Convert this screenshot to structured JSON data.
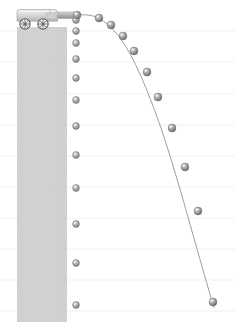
{
  "figure": {
    "domain_type": "diagram",
    "canvas": {
      "width": 235,
      "height": 330,
      "background": "#ffffff"
    },
    "colors": {
      "background": "#ffffff",
      "gridline": "#f0f0f0",
      "column_fill": "#d0d0d0",
      "column_edge": "#c4c4c4",
      "sphere_body": "#9a9a9a",
      "sphere_shadow": "#6d6d6d",
      "sphere_highlight": "#e8e8e8",
      "sphere_outline": "#7c7c7c",
      "trajectory_line": "#9e9e9e",
      "cart_body": "#d9d9d9",
      "cart_edge": "#9d9d9d",
      "cart_dark": "#a8a8a8",
      "wheel_rim": "#6f6f6f",
      "barrel": "#b5b5b5"
    }
  },
  "support_column": {
    "label": "textured gray support column",
    "x": 17,
    "y": 27,
    "width": 50,
    "height": 295,
    "fill": "#d3d3d3"
  },
  "launcher": {
    "label": "spring-loaded launcher cart",
    "body": {
      "x": 16,
      "y": 9,
      "width": 42,
      "height": 13
    },
    "barrel": {
      "x": 55,
      "y": 12,
      "width": 22,
      "height": 7
    },
    "muzzle_x": 76,
    "muzzle_y": 15,
    "wheels": [
      {
        "name": "rear-wheel",
        "cx": 25,
        "cy": 24,
        "r": 5.2
      },
      {
        "name": "front-wheel",
        "cx": 43,
        "cy": 24,
        "r": 5.2
      }
    ]
  },
  "gridlines": {
    "label": "faint horizontal reference lines",
    "x_start": 0,
    "x_end": 235,
    "y_values": [
      31,
      62,
      94,
      125,
      156,
      187,
      218,
      249,
      280,
      311
    ],
    "color": "#f1f1f1",
    "width": 1
  },
  "free_fall_column": {
    "label": "ball released from rest, dropped vertically",
    "x": 76,
    "radius": 3.4,
    "y_values": [
      20,
      31,
      43,
      59,
      78,
      100,
      126,
      155,
      188,
      224,
      263,
      305
    ],
    "count": 12
  },
  "trajectory": {
    "label": "ball launched horizontally, parabolic path",
    "line_color": "#9e9e9e",
    "line_width": 1,
    "radius": 3.9,
    "points": [
      {
        "x": 77,
        "y": 15
      },
      {
        "x": 99,
        "y": 18
      },
      {
        "x": 111,
        "y": 25
      },
      {
        "x": 123,
        "y": 36
      },
      {
        "x": 134,
        "y": 51
      },
      {
        "x": 147,
        "y": 72
      },
      {
        "x": 158,
        "y": 97
      },
      {
        "x": 172,
        "y": 128
      },
      {
        "x": 185,
        "y": 167
      },
      {
        "x": 198,
        "y": 211
      },
      {
        "x": 213,
        "y": 302
      }
    ],
    "path": "M 77 15 C 88 14.2 95 15.6 101 19.5 C 108 24 115 31 121 39.5 C 128 49 134 61 140 74 C 147 90 154 108 161 128 C 168 149 175 172 182 196 C 190 224 200 260 214 308"
  }
}
